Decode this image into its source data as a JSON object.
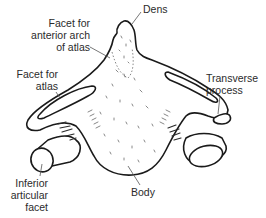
{
  "figure": {
    "labels": {
      "dens": "Dens",
      "facet_anterior_arch": "Facet for\nanterior arch\nof atlas",
      "facet_atlas": "Facet for\natlas",
      "transverse_process": "Transverse\nprocess",
      "inferior_articular_facet": "Inferior\narticular\nfacet",
      "body": "Body"
    },
    "colors": {
      "outline": "#1a1a1a",
      "text": "#2b2b2b",
      "leader": "#555555",
      "stipple": "#6a6a6a",
      "background": "#ffffff"
    }
  }
}
